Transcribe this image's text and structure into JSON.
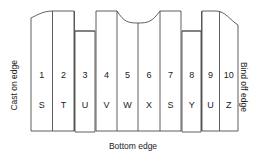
{
  "diagram": {
    "edge_labels": {
      "left": "Cast on edge",
      "right": "Bind off edge",
      "bottom": "Bottom edge"
    },
    "columns": [
      {
        "number": "1",
        "letter": "S"
      },
      {
        "number": "2",
        "letter": "T"
      },
      {
        "number": "3",
        "letter": "U"
      },
      {
        "number": "4",
        "letter": "V"
      },
      {
        "number": "5",
        "letter": "W"
      },
      {
        "number": "6",
        "letter": "X"
      },
      {
        "number": "7",
        "letter": "S"
      },
      {
        "number": "8",
        "letter": "Y"
      },
      {
        "number": "9",
        "letter": "U"
      },
      {
        "number": "10",
        "letter": "Z"
      }
    ],
    "colors": {
      "stroke": "#4d4d4d",
      "text": "#1a1a1a",
      "background": "#ffffff"
    }
  }
}
